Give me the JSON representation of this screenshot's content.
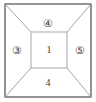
{
  "figure": {
    "type": "labeled-region-diagram",
    "background_color": "#ffffff",
    "outer_border_color": "#3c3c3c",
    "inner_line_color": "#a8a8a8",
    "diagonal_line_color": "#9a9a9a",
    "label_color": "#3a3a3a"
  },
  "regions": {
    "top": {
      "label": "④",
      "plain_value": "4",
      "circled": true,
      "shape": "trapezoid",
      "position": "top"
    },
    "left": {
      "label": "③",
      "plain_value": "3",
      "circled": true,
      "shape": "trapezoid",
      "position": "left"
    },
    "center": {
      "label": "1",
      "plain_value": "1",
      "circled": false,
      "shape": "square",
      "position": "center"
    },
    "right": {
      "label": "⑤",
      "plain_value": "5",
      "circled": true,
      "shape": "trapezoid",
      "position": "right"
    },
    "bottom": {
      "label": "4",
      "plain_value": "4",
      "circled": false,
      "shape": "trapezoid",
      "position": "bottom"
    }
  },
  "geometry": {
    "outer": {
      "x1": 5,
      "y1": 4,
      "x2": 91,
      "y2": 97
    },
    "inner": {
      "x1": 31,
      "y1": 32,
      "x2": 67,
      "y2": 68
    },
    "label_positions": {
      "top": {
        "x": 48,
        "y": 23
      },
      "left": {
        "x": 17,
        "y": 50
      },
      "center": {
        "x": 49,
        "y": 50
      },
      "right": {
        "x": 80,
        "y": 50
      },
      "bottom": {
        "x": 48,
        "y": 83
      }
    }
  }
}
